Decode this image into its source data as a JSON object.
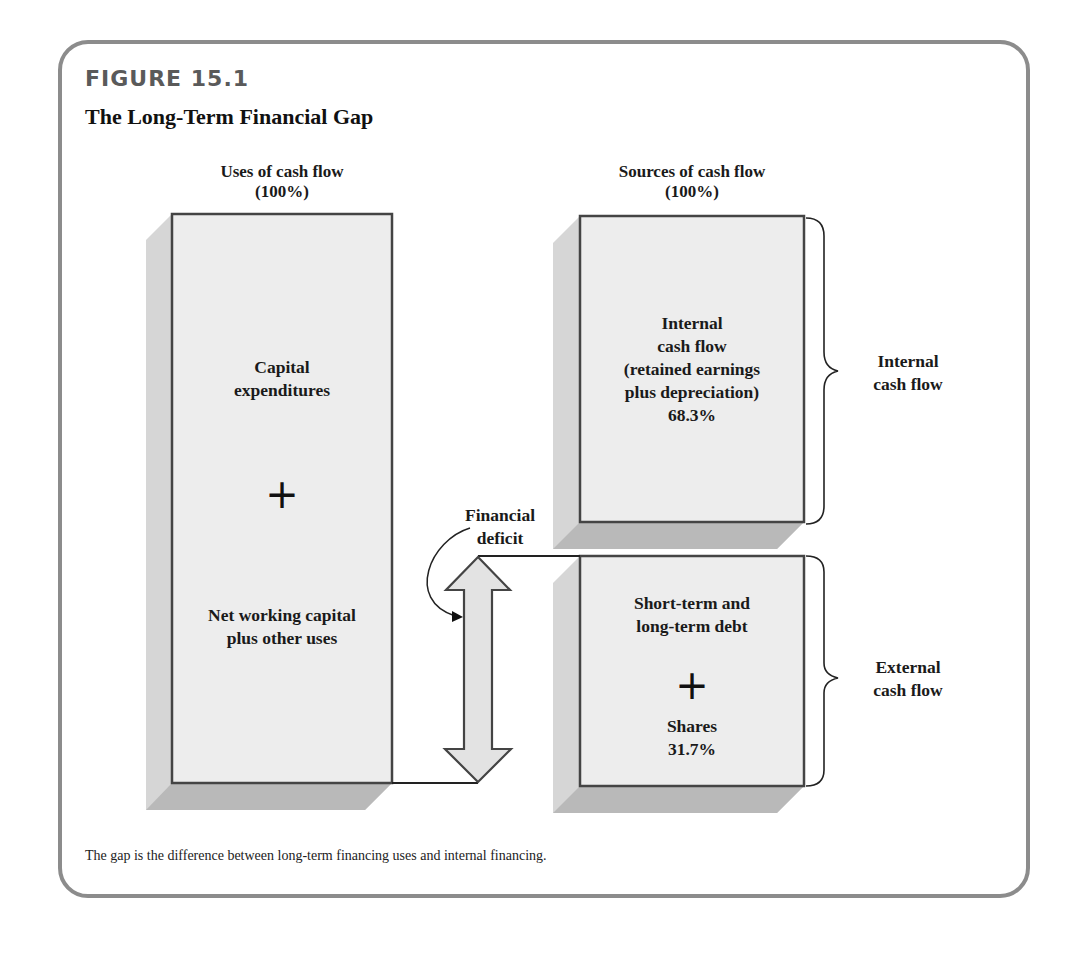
{
  "figure": {
    "label": "FIGURE 15.1",
    "title": "The Long-Term Financial Gap",
    "caption": "The gap is the difference between long-term financing uses and internal financing."
  },
  "uses": {
    "heading_line1": "Uses of cash flow",
    "heading_line2": "(100%)",
    "item1_line1": "Capital",
    "item1_line2": "expenditures",
    "plus": "+",
    "item2_line1": "Net working capital",
    "item2_line2": "plus other uses"
  },
  "sources": {
    "heading_line1": "Sources of cash flow",
    "heading_line2": "(100%)",
    "internal": {
      "line1": "Internal",
      "line2": "cash flow",
      "line3": "(retained earnings",
      "line4": "plus depreciation)",
      "percent": "68.3%"
    },
    "external": {
      "line1": "Short-term and",
      "line2": "long-term debt",
      "plus": "+",
      "line3": "Shares",
      "percent": "31.7%"
    }
  },
  "brace_labels": {
    "internal_line1": "Internal",
    "internal_line2": "cash flow",
    "external_line1": "External",
    "external_line2": "cash flow"
  },
  "deficit": {
    "line1": "Financial",
    "line2": "deficit"
  },
  "colors": {
    "frame": "#8c8c8c",
    "box_fill": "#ececec",
    "box_border": "#444444",
    "shadow_side": "#d4d4d4",
    "shadow_bottom": "#b8b8b8"
  }
}
